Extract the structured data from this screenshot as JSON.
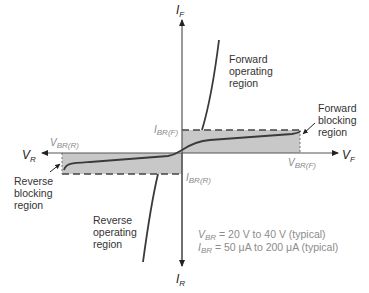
{
  "diagram": {
    "type": "SCR / thyristor I-V characteristic",
    "axes": {
      "if_label": "I",
      "if_sub": "F",
      "ir_label": "I",
      "ir_sub": "R",
      "vf_label": "V",
      "vf_sub": "F",
      "vr_label": "V",
      "vr_sub": "R"
    },
    "markers": {
      "ibr_f": {
        "main": "I",
        "sub": "BR(F)"
      },
      "ibr_r": {
        "main": "I",
        "sub": "BR(R)"
      },
      "vbr_f": {
        "main": "V",
        "sub": "BR(F)"
      },
      "vbr_r": {
        "main": "V",
        "sub": "BR(R)"
      }
    },
    "regions": {
      "forward_operating": [
        "Forward",
        "operating",
        "region"
      ],
      "forward_blocking": [
        "Forward",
        "blocking",
        "region"
      ],
      "reverse_blocking": [
        "Reverse",
        "blocking",
        "region"
      ],
      "reverse_operating": [
        "Reverse",
        "operating",
        "region"
      ]
    },
    "notes": {
      "vbr": {
        "main": "V",
        "sub": "BR",
        "text": " = 20 V to 40 V (typical)"
      },
      "ibr": {
        "main": "I",
        "sub": "BR",
        "text": " = 50 μA to 200 μA (typical)"
      }
    },
    "colors": {
      "curve": "#3a3a3a",
      "axis": "#555555",
      "shade": "#c8c8c8",
      "gray_text": "#8a8a8a"
    }
  }
}
